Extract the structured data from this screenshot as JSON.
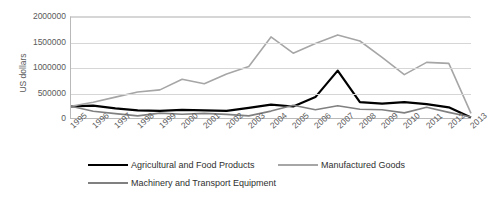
{
  "chart_data": {
    "type": "line",
    "title": "",
    "xlabel": "",
    "ylabel": "US dollars",
    "ylim": [
      0,
      2000000
    ],
    "ytick_labels": [
      "0",
      "500000",
      "1000000",
      "1500000",
      "2000000"
    ],
    "ytick_values": [
      0,
      500000,
      1000000,
      1500000,
      2000000
    ],
    "grid": true,
    "legend_position": "bottom",
    "categories": [
      "1995",
      "1996",
      "1997",
      "1998",
      "1999",
      "2000",
      "2001",
      "2002",
      "2003",
      "2004",
      "2005",
      "2006",
      "2007",
      "2008",
      "2009",
      "2010",
      "2011",
      "2012",
      "2013"
    ],
    "series": [
      {
        "name": "Agricultural and Food Products",
        "color": "#000000",
        "values": [
          250000,
          260000,
          210000,
          170000,
          160000,
          180000,
          170000,
          160000,
          220000,
          280000,
          245000,
          430000,
          950000,
          330000,
          300000,
          330000,
          290000,
          230000,
          30000
        ]
      },
      {
        "name": "Manufactured Goods",
        "color": "#a6a6a6",
        "values": [
          250000,
          330000,
          430000,
          530000,
          570000,
          780000,
          690000,
          880000,
          1030000,
          1610000,
          1290000,
          1480000,
          1650000,
          1530000,
          1210000,
          870000,
          1110000,
          1090000,
          110000
        ]
      },
      {
        "name": "Machinery and Transport Equipment",
        "color": "#808080",
        "values": [
          250000,
          150000,
          105000,
          60000,
          115000,
          95000,
          110000,
          90000,
          60000,
          155000,
          270000,
          180000,
          260000,
          190000,
          180000,
          120000,
          230000,
          130000,
          40000
        ]
      }
    ]
  }
}
